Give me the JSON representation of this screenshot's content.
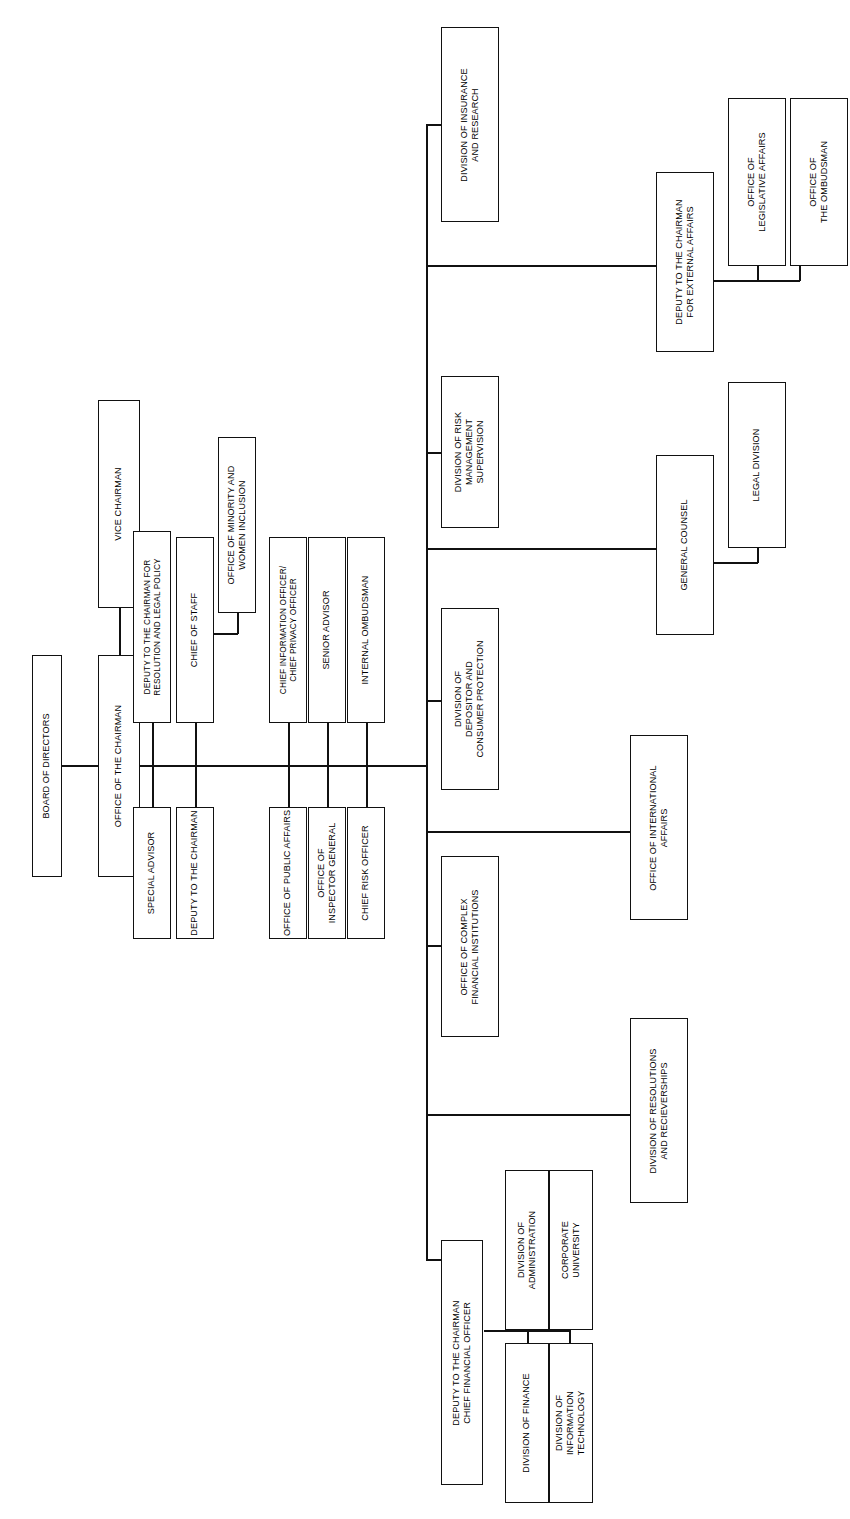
{
  "chart": {
    "type": "org-chart",
    "title": "",
    "orientation": "rotated-90-counterclockwise",
    "background": "#ffffff",
    "line_color": "#111111",
    "box_fill": "#ffffff",
    "nodes": {
      "board_of_directors": "BOARD OF DIRECTORS",
      "office_of_the_chairman": "OFFICE OF THE CHAIRMAN",
      "vice_chairman": "VICE CHAIRMAN",
      "deputy_resolution_legal_policy": "DEPUTY TO THE CHAIRMAN FOR\nRESOLUTION AND LEGAL POLICY",
      "chief_of_staff": "CHIEF OF STAFF",
      "office_minority_women_inclusion": "OFFICE OF MINORITY AND\nWOMEN INCLUSION",
      "chief_information_privacy_officer": "CHIEF INFORMATION OFFICER/\nCHIEF PRIVACY OFFICER",
      "senior_advisor": "SENIOR ADVISOR",
      "internal_ombudsman": "INTERNAL OMBUDSMAN",
      "special_advisor": "SPECIAL ADVISOR",
      "deputy_to_the_chairman": "DEPUTY TO THE CHAIRMAN",
      "office_of_public_affairs": "OFFICE OF PUBLIC AFFAIRS",
      "office_of_inspector_general": "OFFICE OF\nINSPECTOR GENERAL",
      "chief_risk_officer": "CHIEF RISK OFFICER",
      "division_insurance_research": "DIVISION OF INSURANCE\nAND RESEARCH",
      "division_risk_management_supervision": "DIVISION OF RISK\nMANAGEMENT\nSUPERVISION",
      "division_depositor_consumer_protection": "DIVISION OF\nDEPOSITOR AND\nCONSUMER PROTECTION",
      "office_complex_financial_institutions": "OFFICE OF COMPLEX\nFINANCIAL INSTITUTIONS",
      "deputy_chairman_cfo": "DEPUTY TO THE CHAIRMAN\nCHIEF FINANCIAL OFFICER",
      "deputy_chairman_external_affairs": "DEPUTY TO THE CHAIRMAN\nFOR EXTERNAL AFFAIRS",
      "office_of_legislative_affairs": "OFFICE OF\nLEGISLATIVE AFFAIRS",
      "office_of_the_ombudsman": "OFFICE OF\nTHE OMBUDSMAN",
      "general_counsel": "GENERAL COUNSEL",
      "legal_division": "LEGAL DIVISION",
      "office_of_international_affairs": "OFFICE OF INTERNATIONAL\nAFFAIRS",
      "division_resolutions_receiverships": "DIVISION OF RESOLUTIONS\nAND RECIEVERSHIPS",
      "division_of_administration": "DIVISION OF\nADMINISTRATION",
      "corporate_university": "CORPORATE\nUNIVERSITY",
      "division_of_finance": "DIVISION OF FINANCE",
      "division_of_information_technology": "DIVISION OF\nINFORMATION\nTECHNOLOGY"
    }
  }
}
